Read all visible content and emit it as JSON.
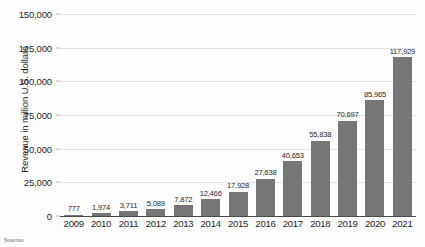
{
  "chart_data": {
    "type": "bar",
    "title": "",
    "xlabel": "",
    "ylabel": "Revenue in million U.S. dollars",
    "ylim": [
      0,
      150000
    ],
    "grid": true,
    "legend": "none",
    "y_ticks": [
      "0",
      "25,000",
      "50,000",
      "75,000",
      "100,000",
      "125,000",
      "150,000"
    ],
    "y_tick_values": [
      0,
      25000,
      50000,
      75000,
      100000,
      125000,
      150000
    ],
    "categories": [
      "2009",
      "2010",
      "2011",
      "2012",
      "2013",
      "2014",
      "2015",
      "2016",
      "2017",
      "2018",
      "2019",
      "2020",
      "2021"
    ],
    "values": [
      777,
      1974,
      3711,
      5089,
      7872,
      12466,
      17928,
      27638,
      40653,
      55838,
      70697,
      85965,
      117929
    ],
    "value_labels": [
      "777",
      "1,974",
      "3,711",
      "5,089",
      "7,872",
      "12,466",
      "17,928",
      "27,638",
      "40,653",
      "55,838",
      "70,697",
      "85,965",
      "117,929"
    ],
    "bar_color": "#767676",
    "gridline_color": "#e2e2e2",
    "axis_color": "#4a4a4a"
  },
  "footer": {
    "source_label": "Sources",
    "attribution": ""
  }
}
